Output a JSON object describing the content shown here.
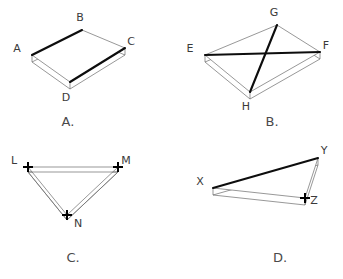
{
  "page": {
    "background_color": "#ffffff",
    "width": 343,
    "height": 279
  },
  "colors": {
    "thin_line": "#6b6b6b",
    "bold_line": "#0d0d0d",
    "medium_line": "#2b2b2b",
    "label_text": "#3a3a3a",
    "caption_text": "#4a4a4a",
    "marker": "#000000",
    "face": "#ffffff"
  },
  "figures": [
    {
      "id": "figure-a",
      "caption": "A.",
      "caption_x": 68,
      "caption_y": 126,
      "shape": "parallelogram",
      "description": "Parallelogram ABCD rendered as a thin three-dimensional slab with bold top and bottom edges",
      "depth": 7,
      "vertices": [
        {
          "name": "A",
          "x": 32,
          "y": 55,
          "label_x": 17,
          "label_y": 52,
          "marker": "none"
        },
        {
          "name": "B",
          "x": 82,
          "y": 30,
          "label_x": 80,
          "label_y": 21,
          "marker": "none"
        },
        {
          "name": "C",
          "x": 125,
          "y": 48,
          "label_x": 131,
          "label_y": 45,
          "marker": "none"
        },
        {
          "name": "D",
          "x": 70,
          "y": 82,
          "label_x": 66,
          "label_y": 101,
          "marker": "none"
        }
      ],
      "bold_edges": [
        [
          "A",
          "B"
        ],
        [
          "D",
          "C"
        ]
      ],
      "thin_edges": [
        [
          "B",
          "C"
        ],
        [
          "A",
          "D"
        ]
      ]
    },
    {
      "id": "figure-b",
      "caption": "B.",
      "caption_x": 272,
      "caption_y": 126,
      "shape": "parallelogram-with-diagonals",
      "description": "Parallelogram EGFH rendered as a thin slab with bold diagonals EF and GH crossing at the centre",
      "depth": 7,
      "vertices": [
        {
          "name": "E",
          "x": 205,
          "y": 55,
          "label_x": 190,
          "label_y": 52,
          "marker": "none"
        },
        {
          "name": "G",
          "x": 277,
          "y": 25,
          "label_x": 274,
          "label_y": 16,
          "marker": "none"
        },
        {
          "name": "F",
          "x": 320,
          "y": 52,
          "label_x": 326,
          "label_y": 49,
          "marker": "none"
        },
        {
          "name": "H",
          "x": 250,
          "y": 92,
          "label_x": 246,
          "label_y": 110,
          "marker": "none"
        }
      ],
      "bold_edges": [
        [
          "E",
          "F"
        ],
        [
          "G",
          "H"
        ]
      ],
      "thin_edges": [
        [
          "E",
          "G"
        ],
        [
          "G",
          "F"
        ],
        [
          "F",
          "H"
        ],
        [
          "H",
          "E"
        ]
      ]
    },
    {
      "id": "figure-c",
      "caption": "C.",
      "caption_x": 73,
      "caption_y": 262,
      "shape": "triangle",
      "description": "Triangle LMN drawn with outlined double-line edges and plus-shaped markers at every vertex",
      "depth": 5,
      "vertices": [
        {
          "name": "L",
          "x": 28,
          "y": 167,
          "label_x": 14,
          "label_y": 164,
          "marker": "cross"
        },
        {
          "name": "M",
          "x": 118,
          "y": 167,
          "label_x": 126,
          "label_y": 164,
          "marker": "cross"
        },
        {
          "name": "N",
          "x": 67,
          "y": 215,
          "label_x": 78,
          "label_y": 227,
          "marker": "cross"
        }
      ],
      "bold_edges": [],
      "thin_edges": [
        [
          "L",
          "M"
        ],
        [
          "M",
          "N"
        ],
        [
          "N",
          "L"
        ]
      ]
    },
    {
      "id": "figure-d",
      "caption": "D.",
      "caption_x": 280,
      "caption_y": 262,
      "shape": "triangle",
      "description": "Narrow triangle XYZ rendered as a thin slab with a bold XY edge and a plus-shaped marker at Z",
      "depth": 7,
      "vertices": [
        {
          "name": "X",
          "x": 213,
          "y": 188,
          "label_x": 200,
          "label_y": 185,
          "marker": "none"
        },
        {
          "name": "Y",
          "x": 318,
          "y": 158,
          "label_x": 324,
          "label_y": 154,
          "marker": "none"
        },
        {
          "name": "Z",
          "x": 305,
          "y": 198,
          "label_x": 314,
          "label_y": 204,
          "marker": "cross"
        }
      ],
      "bold_edges": [
        [
          "X",
          "Y"
        ]
      ],
      "thin_edges": [
        [
          "Y",
          "Z"
        ],
        [
          "Z",
          "X"
        ]
      ]
    }
  ]
}
